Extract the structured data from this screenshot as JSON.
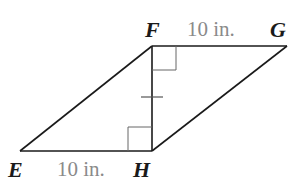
{
  "diagram": {
    "type": "parallelogram",
    "vertices": {
      "E": {
        "label": "E",
        "x": 20,
        "y": 151
      },
      "F": {
        "label": "F",
        "x": 152,
        "y": 46
      },
      "G": {
        "label": "G",
        "x": 287,
        "y": 46
      },
      "H": {
        "label": "H",
        "x": 152,
        "y": 151
      }
    },
    "measurements": {
      "FG": "10 in.",
      "EH": "10 in."
    },
    "altitude": {
      "from": "F",
      "to": "H",
      "tick_marks": 1
    },
    "right_angles": [
      "F",
      "H"
    ],
    "colors": {
      "stroke": "#1a1a1a",
      "measure_text": "#8a8a8a",
      "right_angle_box": "#555555"
    }
  }
}
